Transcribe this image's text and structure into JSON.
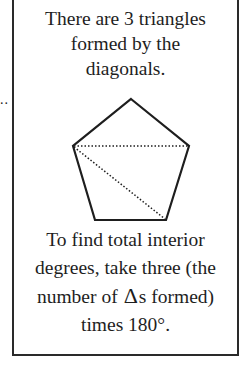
{
  "leader": "..",
  "top_text": [
    "There are 3 triangles",
    "formed by the",
    "diagonals."
  ],
  "bottom_text": {
    "line1": "To find total interior",
    "line2": "degrees, take three (the",
    "line3_pre": "number of",
    "delta_symbol": "Δ",
    "line3_post": "s formed)",
    "line4": "times 180°."
  },
  "figure": {
    "shape": "pentagon",
    "vertices": [
      [
        129,
        97
      ],
      [
        187,
        144
      ],
      [
        164,
        218
      ],
      [
        93,
        218
      ],
      [
        71,
        144
      ]
    ],
    "diagonals": [
      [
        [
          71,
          144
        ],
        [
          187,
          144
        ]
      ],
      [
        [
          71,
          144
        ],
        [
          164,
          218
        ]
      ]
    ],
    "stroke_color": "#1e1e1e"
  }
}
